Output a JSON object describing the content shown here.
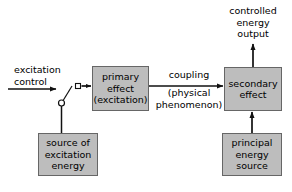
{
  "diagram": {
    "colors": {
      "box_fill": "#bdbdbd",
      "box_border": "#666666",
      "stroke": "#111111",
      "background": "#ffffff"
    },
    "nodes": {
      "primary_effect": {
        "lines": [
          "primary",
          "effect",
          "(excitation)"
        ]
      },
      "secondary_effect": {
        "lines": [
          "secondary",
          "effect"
        ]
      },
      "source_of_excitation_energy": {
        "lines": [
          "source of",
          "excitation",
          "energy"
        ]
      },
      "principal_energy_source": {
        "lines": [
          "principal",
          "energy",
          "source"
        ]
      }
    },
    "labels": {
      "excitation_control": {
        "lines": [
          "excitation",
          "control"
        ]
      },
      "coupling": {
        "lines": [
          "coupling"
        ]
      },
      "physical_phenomenon": {
        "lines": [
          "(physical",
          "phenomenon)"
        ]
      },
      "controlled_energy_output": {
        "lines": [
          "controlled",
          "energy",
          "output"
        ]
      }
    },
    "symbols": {
      "switch": "open-switch-symbol",
      "switch_terminal": "square-terminal",
      "switch_pivot": "circle-terminal"
    },
    "connectors": [
      {
        "name": "excitation-control-input-arrow",
        "from": "excitation control label",
        "to": "switch blade"
      },
      {
        "name": "switch-to-primary-effect-arrow",
        "from": "switch terminal",
        "to": "primary effect"
      },
      {
        "name": "source-excitation-to-switch-line",
        "from": "source of excitation energy",
        "to": "switch pivot"
      },
      {
        "name": "primary-to-secondary-coupling-arrow",
        "from": "primary effect",
        "to": "secondary effect"
      },
      {
        "name": "secondary-to-output-arrow",
        "from": "secondary effect",
        "to": "controlled energy output"
      },
      {
        "name": "principal-source-to-secondary-arrow",
        "from": "principal energy source",
        "to": "secondary effect"
      }
    ]
  }
}
